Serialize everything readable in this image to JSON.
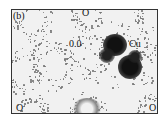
{
  "figure": {
    "panel_label": "(b)",
    "labels": {
      "top_atom": "O",
      "contour_value": "0.0",
      "metal_atom": "Cu",
      "bottom_left_atom": "O",
      "bottom_right_atom": "O"
    },
    "colors": {
      "background": "#f1f1f1",
      "density_dark": "#1a1a1a",
      "density_speckle": "#8a8a8a",
      "border": "#333333"
    }
  }
}
